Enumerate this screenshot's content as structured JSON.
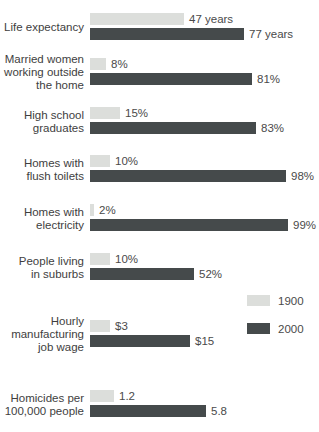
{
  "chart_data": {
    "type": "bar",
    "orientation": "horizontal",
    "grid": false,
    "legend_position": "right-middle",
    "series_names": [
      "1900",
      "2000"
    ],
    "colors": {
      "series_1900": "#dcdedb",
      "series_2000": "#454a4b",
      "label_text": "#3e3e3e",
      "value_text": "#4a4a4a",
      "background": "#ffffff"
    },
    "rows": [
      {
        "category": "Life expectancy",
        "label_lines": [
          "Life expectancy"
        ],
        "values": [
          47,
          77
        ],
        "value_labels": [
          "47 years",
          "77 years"
        ],
        "unit": "years",
        "px_per_unit": 2
      },
      {
        "category": "Married women working outside the home",
        "label_lines": [
          "Married women",
          "working outside",
          "the home"
        ],
        "values": [
          8,
          81
        ],
        "value_labels": [
          "8%",
          "81%"
        ],
        "unit": "%",
        "px_per_unit": 2
      },
      {
        "category": "High school graduates",
        "label_lines": [
          "High school",
          "graduates"
        ],
        "values": [
          15,
          83
        ],
        "value_labels": [
          "15%",
          "83%"
        ],
        "unit": "%",
        "px_per_unit": 2
      },
      {
        "category": "Homes with flush toilets",
        "label_lines": [
          "Homes with",
          "flush toilets"
        ],
        "values": [
          10,
          98
        ],
        "value_labels": [
          "10%",
          "98%"
        ],
        "unit": "%",
        "px_per_unit": 2
      },
      {
        "category": "Homes with electricity",
        "label_lines": [
          "Homes with",
          "electricity"
        ],
        "values": [
          2,
          99
        ],
        "value_labels": [
          "2%",
          "99%"
        ],
        "unit": "%",
        "px_per_unit": 2
      },
      {
        "category": "People living in suburbs",
        "label_lines": [
          "People living",
          "in suburbs"
        ],
        "values": [
          10,
          52
        ],
        "value_labels": [
          "10%",
          "52%"
        ],
        "unit": "%",
        "px_per_unit": 2
      },
      {
        "category": "Hourly manufacturing job wage",
        "label_lines": [
          "Hourly",
          "manufacturing",
          "job wage"
        ],
        "values": [
          3,
          15
        ],
        "value_labels": [
          "$3",
          "$15"
        ],
        "unit": "$",
        "px_per_unit": 6.67
      },
      {
        "category": "Homicides per 100,000 people",
        "label_lines": [
          "Homicides per",
          "100,000 people"
        ],
        "values": [
          1.2,
          5.8
        ],
        "value_labels": [
          "1.2",
          "5.8"
        ],
        "unit": "per 100,000",
        "px_per_unit": 20
      }
    ],
    "row_tops_px": [
      13,
      58,
      107,
      155,
      204,
      253,
      320,
      390
    ],
    "legend": {
      "items": [
        {
          "label": "1900"
        },
        {
          "label": "2000"
        }
      ]
    }
  }
}
